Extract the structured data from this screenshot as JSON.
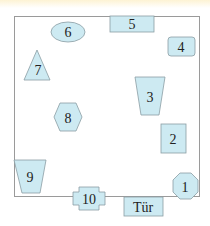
{
  "diagram": {
    "title": "",
    "room": {
      "description": "Floor plan outline"
    },
    "fill_color": "#cdeaf2",
    "stroke_color": "#8a9da3",
    "objects": [
      {
        "id": "1",
        "label": "1",
        "shape": "octagon"
      },
      {
        "id": "2",
        "label": "2",
        "shape": "rectangle"
      },
      {
        "id": "3",
        "label": "3",
        "shape": "trapezoid"
      },
      {
        "id": "4",
        "label": "4",
        "shape": "rounded-rectangle"
      },
      {
        "id": "5",
        "label": "5",
        "shape": "rectangle"
      },
      {
        "id": "6",
        "label": "6",
        "shape": "ellipse"
      },
      {
        "id": "7",
        "label": "7",
        "shape": "triangle"
      },
      {
        "id": "8",
        "label": "8",
        "shape": "hexagon"
      },
      {
        "id": "9",
        "label": "9",
        "shape": "trapezoid"
      },
      {
        "id": "10",
        "label": "10",
        "shape": "cross-rectangle"
      }
    ],
    "door": {
      "label": "Tür"
    }
  }
}
